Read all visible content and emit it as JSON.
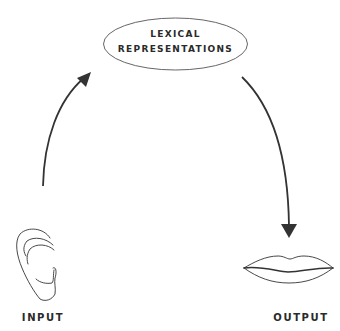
{
  "diagram": {
    "node": {
      "line1": "LEXICAL",
      "line2": "REPRESENTATIONS",
      "shape": "ellipse"
    },
    "input": {
      "label": "INPUT",
      "icon": "ear-icon"
    },
    "output": {
      "label": "OUTPUT",
      "icon": "lips-icon"
    },
    "edges": [
      {
        "from": "INPUT",
        "to": "LEXICAL REPRESENTATIONS",
        "direction": "up"
      },
      {
        "from": "LEXICAL REPRESENTATIONS",
        "to": "OUTPUT",
        "direction": "down"
      }
    ],
    "colors": {
      "stroke": "#333333",
      "text": "#2a2a2a",
      "background": "#ffffff"
    }
  }
}
